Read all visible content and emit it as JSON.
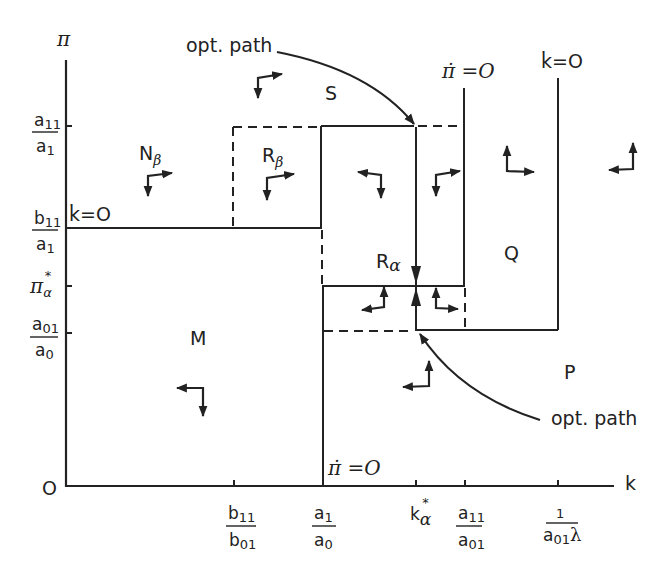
{
  "axes": {
    "y_label": "π",
    "x_label": "k",
    "origin_label": "O"
  },
  "y_ticks": [
    {
      "id": "a11_over_a1",
      "num": "a",
      "num_sub": "11",
      "den": "a",
      "den_sub": "1"
    },
    {
      "id": "b11_over_a1",
      "num": "b",
      "num_sub": "11",
      "den": "a",
      "den_sub": "1"
    },
    {
      "id": "pi_alpha_star",
      "main": "π",
      "sub": "α",
      "sup": "*"
    },
    {
      "id": "a01_over_a0",
      "num": "a",
      "num_sub": "01",
      "den": "a",
      "den_sub": "0"
    }
  ],
  "x_ticks": [
    {
      "id": "b11_over_b01",
      "num": "b",
      "num_sub": "11",
      "den": "b",
      "den_sub": "01"
    },
    {
      "id": "a1_over_a0",
      "num": "a",
      "num_sub": "1",
      "den": "a",
      "den_sub": "0"
    },
    {
      "id": "k_alpha_star",
      "main": "k",
      "sub": "α",
      "sup": "*"
    },
    {
      "id": "a11_over_a01",
      "num": "a",
      "num_sub": "11",
      "den": "a",
      "den_sub": "01"
    },
    {
      "id": "one_over_a01_lambda",
      "num": "1",
      "den": "a",
      "den_sub": "01",
      "den_tail": "λ"
    }
  ],
  "isoclines": {
    "pi_dot_zero_top": "π̇ =O",
    "pi_dot_zero_bottom": "π̇ =O",
    "k_dot_zero_top": "k̇=O",
    "k_dot_zero_left": "k̇=O"
  },
  "regions": {
    "S": "S",
    "N_beta": {
      "main": "N",
      "sub": "β"
    },
    "R_beta": {
      "main": "R",
      "sub": "β"
    },
    "R_alpha": {
      "main": "R",
      "sub": "α"
    },
    "Q": "Q",
    "M": "M",
    "P": "P"
  },
  "annotations": {
    "opt_path_top": "opt. path",
    "opt_path_bottom": "opt. path"
  },
  "colors": {
    "ink": "#222222",
    "background": "#ffffff"
  }
}
